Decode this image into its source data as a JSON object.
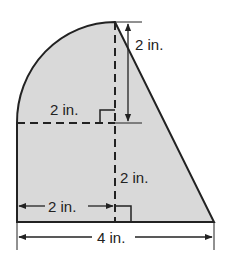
{
  "diagram": {
    "type": "composite-area-figure",
    "colors": {
      "fill": "#d9d9d9",
      "stroke": "#222222",
      "background": "#ffffff"
    },
    "labels": {
      "top_right_height": "2 in.",
      "radius_horizontal": "2 in.",
      "lower_height": "2 in.",
      "bottom_left_width": "2 in.",
      "total_width": "4 in."
    },
    "shapes": [
      {
        "name": "quarter-circle",
        "radius": "2 in."
      },
      {
        "name": "rectangle",
        "width": "2 in.",
        "height": "2 in."
      },
      {
        "name": "right-triangle",
        "base": "2 in.",
        "height": "4 in."
      }
    ],
    "markers": [
      "right-angle-upper",
      "right-angle-lower"
    ]
  }
}
